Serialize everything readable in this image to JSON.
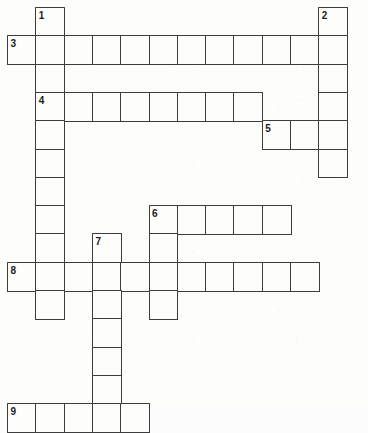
{
  "puzzle": {
    "kind": "crossword-grid",
    "title": "Crossword puzzle grid",
    "cell_size": 28.3,
    "origin_x": 7,
    "origin_y": 7,
    "columns": 12,
    "rows": 15,
    "grid_color": "#3c3c3c",
    "cell_fill": "#fdfdfc",
    "page_background": "#fdfdfc",
    "number_color": "#1b1b1b",
    "cells": [
      {
        "col": 1,
        "row": 0
      },
      {
        "col": 11,
        "row": 0
      },
      {
        "col": 0,
        "row": 1
      },
      {
        "col": 1,
        "row": 1
      },
      {
        "col": 2,
        "row": 1
      },
      {
        "col": 3,
        "row": 1
      },
      {
        "col": 4,
        "row": 1
      },
      {
        "col": 5,
        "row": 1
      },
      {
        "col": 6,
        "row": 1
      },
      {
        "col": 7,
        "row": 1
      },
      {
        "col": 8,
        "row": 1
      },
      {
        "col": 9,
        "row": 1
      },
      {
        "col": 10,
        "row": 1
      },
      {
        "col": 11,
        "row": 1
      },
      {
        "col": 1,
        "row": 2
      },
      {
        "col": 11,
        "row": 2
      },
      {
        "col": 1,
        "row": 3
      },
      {
        "col": 2,
        "row": 3
      },
      {
        "col": 3,
        "row": 3
      },
      {
        "col": 4,
        "row": 3
      },
      {
        "col": 5,
        "row": 3
      },
      {
        "col": 6,
        "row": 3
      },
      {
        "col": 7,
        "row": 3
      },
      {
        "col": 8,
        "row": 3
      },
      {
        "col": 11,
        "row": 3
      },
      {
        "col": 1,
        "row": 4
      },
      {
        "col": 9,
        "row": 4
      },
      {
        "col": 10,
        "row": 4
      },
      {
        "col": 11,
        "row": 4
      },
      {
        "col": 1,
        "row": 5
      },
      {
        "col": 11,
        "row": 5
      },
      {
        "col": 1,
        "row": 6
      },
      {
        "col": 1,
        "row": 7
      },
      {
        "col": 5,
        "row": 7
      },
      {
        "col": 6,
        "row": 7
      },
      {
        "col": 7,
        "row": 7
      },
      {
        "col": 8,
        "row": 7
      },
      {
        "col": 9,
        "row": 7
      },
      {
        "col": 1,
        "row": 8
      },
      {
        "col": 3,
        "row": 8
      },
      {
        "col": 5,
        "row": 8
      },
      {
        "col": 0,
        "row": 9
      },
      {
        "col": 1,
        "row": 9
      },
      {
        "col": 2,
        "row": 9
      },
      {
        "col": 3,
        "row": 9
      },
      {
        "col": 4,
        "row": 9
      },
      {
        "col": 5,
        "row": 9
      },
      {
        "col": 6,
        "row": 9
      },
      {
        "col": 7,
        "row": 9
      },
      {
        "col": 8,
        "row": 9
      },
      {
        "col": 9,
        "row": 9
      },
      {
        "col": 10,
        "row": 9
      },
      {
        "col": 1,
        "row": 10
      },
      {
        "col": 3,
        "row": 10
      },
      {
        "col": 5,
        "row": 10
      },
      {
        "col": 3,
        "row": 11
      },
      {
        "col": 3,
        "row": 12
      },
      {
        "col": 3,
        "row": 13
      },
      {
        "col": 0,
        "row": 14
      },
      {
        "col": 1,
        "row": 14
      },
      {
        "col": 2,
        "row": 14
      },
      {
        "col": 3,
        "row": 14
      },
      {
        "col": 4,
        "row": 14
      }
    ],
    "numbers": [
      {
        "label": "1",
        "col": 1,
        "row": 0
      },
      {
        "label": "2",
        "col": 11,
        "row": 0
      },
      {
        "label": "3",
        "col": 0,
        "row": 1
      },
      {
        "label": "4",
        "col": 1,
        "row": 3
      },
      {
        "label": "5",
        "col": 9,
        "row": 4
      },
      {
        "label": "6",
        "col": 5,
        "row": 7
      },
      {
        "label": "7",
        "col": 3,
        "row": 8
      },
      {
        "label": "8",
        "col": 0,
        "row": 9
      },
      {
        "label": "9",
        "col": 0,
        "row": 14
      }
    ]
  }
}
